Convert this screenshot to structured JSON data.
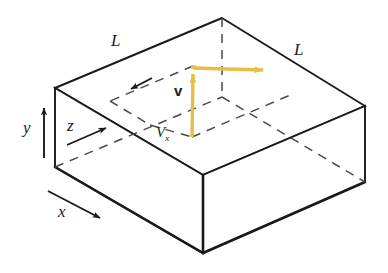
{
  "figure": {
    "background_color": "#ffffff",
    "line_color": "#1a1a1a",
    "vector_color": "#e3bf44",
    "labels": {
      "length_left": "L",
      "length_right": "L",
      "axis_y": "y",
      "axis_z": "z",
      "axis_x": "x",
      "velocity_vector": "v",
      "velocity_component_x": "V",
      "velocity_component_x_sub": "x"
    },
    "geometry": {
      "top_apex": [
        222,
        18
      ],
      "left_top": [
        55,
        88
      ],
      "right_top": [
        365,
        106
      ],
      "front_top": [
        203,
        175
      ],
      "left_bottom": [
        55,
        167
      ],
      "right_bottom": [
        365,
        182
      ],
      "front_bottom": [
        203,
        253
      ],
      "vector_origin": [
        192,
        137
      ],
      "vector_y_tip": [
        193,
        66
      ],
      "vector_x_tip": [
        274,
        69
      ]
    }
  }
}
